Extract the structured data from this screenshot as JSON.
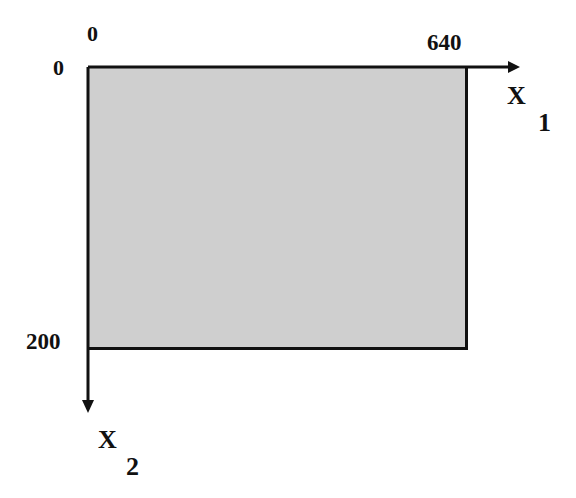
{
  "diagram": {
    "origin_x_label": "0",
    "origin_y_label": "0",
    "x_max_label": "640",
    "y_max_label": "200",
    "x_axis": {
      "name": "X",
      "subscript": "1"
    },
    "y_axis": {
      "name": "X",
      "subscript": "2"
    },
    "colors": {
      "fill": "#cfcfcf",
      "line": "#111111"
    }
  }
}
